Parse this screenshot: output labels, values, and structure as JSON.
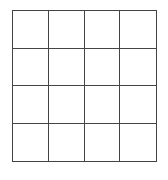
{
  "grid": {
    "rows": 4,
    "columns": 4,
    "line_color": "#444444",
    "cells": [
      [
        "",
        "",
        "",
        ""
      ],
      [
        "",
        "",
        "",
        ""
      ],
      [
        "",
        "",
        "",
        ""
      ],
      [
        "",
        "",
        "",
        ""
      ]
    ]
  }
}
